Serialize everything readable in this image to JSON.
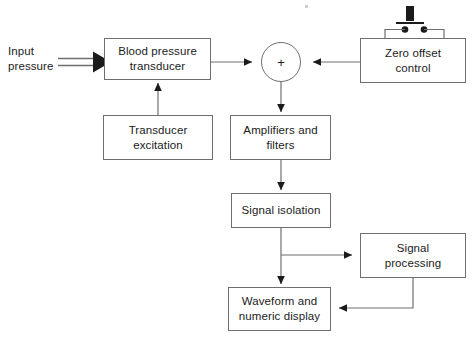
{
  "diagram": {
    "canvas": {
      "width": 473,
      "height": 340
    },
    "line_color": "#6f6f6f",
    "arrow_color": "#1b1b1b",
    "text_color": "#1b1b1b",
    "background": "#ffffff"
  },
  "labels": {
    "input_pressure": "Input\npressure"
  },
  "blocks": [
    {
      "id": "blood-pressure-transducer",
      "label": "Blood pressure\ntransducer",
      "x": 104,
      "y": 38,
      "w": 107,
      "h": 42
    },
    {
      "id": "transducer-excitation",
      "label": "Transducer\nexcitation",
      "x": 103,
      "y": 115,
      "w": 110,
      "h": 45
    },
    {
      "id": "zero-offset-control",
      "label": "Zero offset\ncontrol",
      "x": 360,
      "y": 38,
      "w": 106,
      "h": 45
    },
    {
      "id": "amplifiers-and-filters",
      "label": "Amplifiers and\nfilters",
      "x": 230,
      "y": 115,
      "w": 101,
      "h": 45
    },
    {
      "id": "signal-isolation",
      "label": "Signal isolation",
      "x": 231,
      "y": 193,
      "w": 100,
      "h": 35
    },
    {
      "id": "signal-processing",
      "label": "Signal\nprocessing",
      "x": 360,
      "y": 233,
      "w": 106,
      "h": 45
    },
    {
      "id": "waveform-and-numeric-display",
      "label": "Waveform and\nnumeric display",
      "x": 228,
      "y": 287,
      "w": 103,
      "h": 44
    }
  ],
  "summing_junction": {
    "id": "summing-junction",
    "symbol": "+",
    "cx": 281,
    "cy": 62,
    "r": 20
  },
  "push_button_switch": {
    "id": "push-button-switch",
    "plunger_x": 410,
    "plunger_y": 8,
    "contacts": [
      {
        "x": 405,
        "y": 29
      },
      {
        "x": 424,
        "y": 29
      }
    ]
  },
  "connections": [
    {
      "id": "input-pressure-to-transducer",
      "from": "input-pressure-label",
      "to": "blood-pressure-transducer",
      "style": "hollow-block-arrow"
    },
    {
      "id": "transducer-to-summing-junction",
      "from": "blood-pressure-transducer",
      "to": "summing-junction",
      "style": "solid-arrow"
    },
    {
      "id": "excitation-to-transducer",
      "from": "transducer-excitation",
      "to": "blood-pressure-transducer",
      "style": "solid-arrow"
    },
    {
      "id": "zero-offset-to-summing-junction",
      "from": "zero-offset-control",
      "to": "summing-junction",
      "style": "solid-arrow"
    },
    {
      "id": "summing-junction-to-amplifiers",
      "from": "summing-junction",
      "to": "amplifiers-and-filters",
      "style": "solid-arrow"
    },
    {
      "id": "amplifiers-to-signal-isolation",
      "from": "amplifiers-and-filters",
      "to": "signal-isolation",
      "style": "solid-arrow"
    },
    {
      "id": "signal-isolation-to-display",
      "from": "signal-isolation",
      "to": "waveform-and-numeric-display",
      "style": "solid-arrow"
    },
    {
      "id": "signal-isolation-to-signal-processing",
      "from": "signal-isolation",
      "to": "signal-processing",
      "style": "solid-arrow"
    },
    {
      "id": "signal-processing-to-display",
      "from": "signal-processing",
      "to": "waveform-and-numeric-display",
      "style": "solid-arrow"
    }
  ]
}
